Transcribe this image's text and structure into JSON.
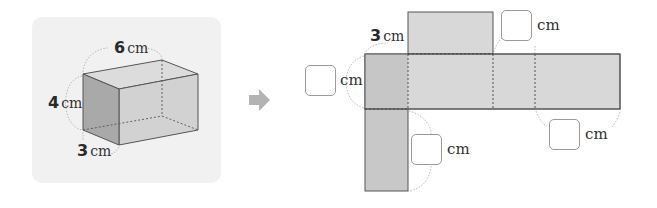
{
  "prism": {
    "length": {
      "value": "6",
      "unit": "cm"
    },
    "height": {
      "value": "4",
      "unit": "cm"
    },
    "width": {
      "value": "3",
      "unit": "cm"
    }
  },
  "arrow": {
    "icon": "right-arrow-icon",
    "color": "#b3b3b3"
  },
  "net": {
    "given_label": {
      "value": "3",
      "unit": "cm"
    },
    "blanks": [
      {
        "id": "left-height",
        "value": "",
        "unit": "cm"
      },
      {
        "id": "top-right",
        "value": "",
        "unit": "cm"
      },
      {
        "id": "bottom-flap",
        "value": "",
        "unit": "cm"
      },
      {
        "id": "bottom-right",
        "value": "",
        "unit": "cm"
      }
    ],
    "face_color": "#d6d6d6",
    "side_face_color": "#c4c4c4"
  }
}
